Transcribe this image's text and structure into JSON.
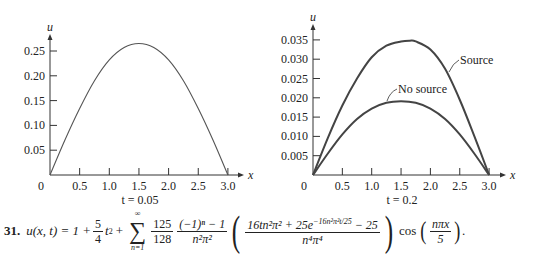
{
  "chart_data": [
    {
      "type": "line",
      "title": "",
      "caption": "t = 0.05",
      "xlabel": "x",
      "ylabel": "u",
      "xlim": [
        0,
        3.0
      ],
      "ylim": [
        0,
        0.27
      ],
      "x_ticks": [
        "0",
        "0.5",
        "1.0",
        "1.5",
        "2.0",
        "2.5",
        "3.0"
      ],
      "y_ticks": [
        "0.05",
        "0.10",
        "0.15",
        "0.20",
        "0.25"
      ],
      "grid": false,
      "series": [
        {
          "name": "u(x, 0.05)",
          "x": [
            0,
            0.25,
            0.5,
            0.75,
            1.0,
            1.25,
            1.5,
            1.75,
            2.0,
            2.25,
            2.5,
            2.75,
            3.0
          ],
          "values": [
            0,
            0.07,
            0.134,
            0.19,
            0.232,
            0.257,
            0.265,
            0.257,
            0.232,
            0.19,
            0.134,
            0.07,
            0
          ]
        }
      ]
    },
    {
      "type": "line",
      "title": "",
      "caption": "t = 0.2",
      "xlabel": "x",
      "ylabel": "u",
      "xlim": [
        0,
        3.0
      ],
      "ylim": [
        0,
        0.037
      ],
      "x_ticks": [
        "0",
        "0.5",
        "1.0",
        "1.5",
        "2.0",
        "2.5",
        "3.0"
      ],
      "y_ticks": [
        "0.005",
        "0.010",
        "0.015",
        "0.020",
        "0.025",
        "0.030",
        "0.035"
      ],
      "grid": false,
      "annotations": [
        "Source",
        "No source"
      ],
      "series": [
        {
          "name": "Source",
          "x": [
            0,
            0.25,
            0.5,
            0.75,
            1.0,
            1.25,
            1.5,
            1.65,
            1.75,
            2.0,
            2.25,
            2.5,
            2.75,
            3.0
          ],
          "values": [
            0,
            0.0095,
            0.018,
            0.025,
            0.0305,
            0.0335,
            0.0346,
            0.0348,
            0.0346,
            0.0325,
            0.0275,
            0.0195,
            0.01,
            0
          ]
        },
        {
          "name": "No source",
          "x": [
            0,
            0.25,
            0.5,
            0.75,
            1.0,
            1.25,
            1.5,
            1.75,
            2.0,
            2.25,
            2.5,
            2.75,
            3.0
          ],
          "values": [
            0,
            0.0055,
            0.0105,
            0.0145,
            0.0172,
            0.0187,
            0.0191,
            0.0187,
            0.0172,
            0.0145,
            0.0105,
            0.0055,
            0
          ]
        }
      ]
    }
  ],
  "equation": {
    "number": "31.",
    "lhs": "u(x, t) = 1 +",
    "frac1_num": "5",
    "frac1_den": "4",
    "t2": "t",
    "t2_exp": "2",
    "plus": "+",
    "sum_top": "∞",
    "sum_sym": "∑",
    "sum_bot": "n=1",
    "frac2_num": "125",
    "frac2_den": "128",
    "frac3_num": "(−1)ⁿ − 1",
    "frac3_den": "n²π²",
    "frac4_num": "16tn²π² + 25e",
    "frac4_exp": "−16n²π²t/25",
    "frac4_num_tail": " − 25",
    "frac4_den": "n⁴π⁴",
    "cos": "cos",
    "frac5_num": "nπx",
    "frac5_den": "5",
    "end": "."
  }
}
